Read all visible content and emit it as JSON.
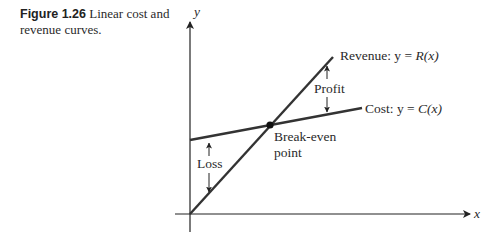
{
  "caption": {
    "figure_number": "Figure 1.26",
    "text": "Linear cost and revenue curves."
  },
  "axes": {
    "x_label": "x",
    "y_label": "y"
  },
  "curves": {
    "revenue": {
      "label_prefix": "Revenue: y = ",
      "label_func": "R(x)"
    },
    "cost": {
      "label_prefix": "Cost: y = ",
      "label_func": "C(x)"
    }
  },
  "annotations": {
    "profit": "Profit",
    "loss": "Loss",
    "break_even_line1": "Break-even",
    "break_even_line2": "point"
  }
}
